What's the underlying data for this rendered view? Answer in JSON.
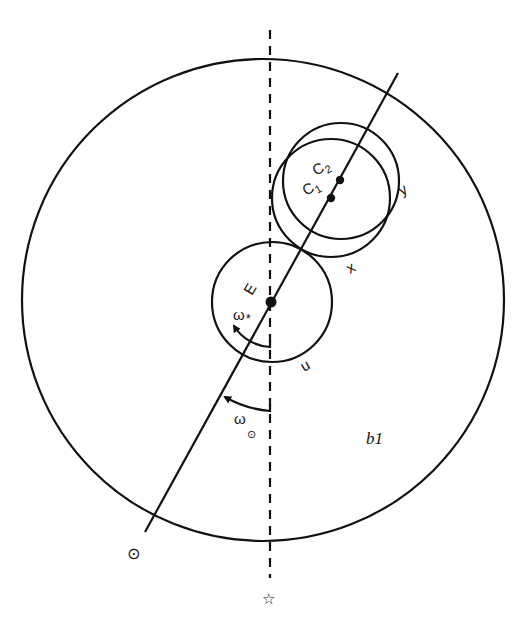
{
  "diagram": {
    "type": "orbital geometry sketch",
    "colors": {
      "ink": "#111111",
      "background": "#ffffff"
    },
    "circles": {
      "outer": {
        "label": "b1",
        "cx": 263,
        "cy": 300,
        "r": 241
      },
      "u": {
        "label": "u",
        "cx": 272,
        "cy": 302,
        "r": 60
      },
      "x": {
        "label": "x",
        "cx": 331,
        "cy": 198,
        "r": 59
      },
      "y": {
        "label": "y",
        "cx": 341,
        "cy": 181,
        "r": 58
      }
    },
    "points": {
      "E": {
        "label": "E",
        "x": 271,
        "y": 302
      },
      "C1": {
        "label": "C",
        "sub": "1",
        "x": 331,
        "y": 198
      },
      "C2": {
        "label": "C",
        "sub": "2",
        "x": 340,
        "y": 180
      }
    },
    "lines": {
      "axis_line": {
        "x1": 398,
        "y1": 73,
        "x2": 145,
        "y2": 532
      },
      "reference_dashed": {
        "x": 270,
        "y1": 30,
        "y2": 578
      }
    },
    "angles": {
      "omega_star": {
        "label": "ω",
        "sub": "*"
      },
      "omega_sun": {
        "label": "ω",
        "sub": "⊙"
      }
    },
    "labels": {
      "b1": "b1",
      "u": "u",
      "x": "x",
      "y": "y",
      "E": "E",
      "C1": "C",
      "C1_sub": "1",
      "C2": "C",
      "C2_sub": "2",
      "omega": "ω",
      "star_sub": "*",
      "sun_sub": "⊙"
    },
    "symbols": {
      "sun": "⊙",
      "star": "☆"
    }
  }
}
